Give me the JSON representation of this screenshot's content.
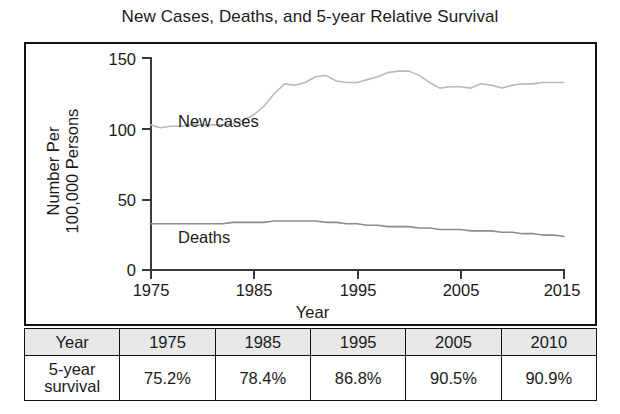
{
  "chart_data": {
    "type": "line",
    "title": "New Cases, Deaths, and 5-year Relative Survival",
    "xlabel": "Year",
    "ylabel": "Number Per 100,000 Persons",
    "ylabel_lines": [
      "Number Per",
      "100,000 Persons"
    ],
    "xlim": [
      1975,
      2015
    ],
    "ylim": [
      0,
      150
    ],
    "yticks": [
      0,
      50,
      100,
      150
    ],
    "xticks": [
      1975,
      1985,
      1995,
      2005,
      2015
    ],
    "grid": false,
    "legend": "inline-labels",
    "line_color": "#b9b9b9",
    "deaths_color": "#8c8c8c",
    "x": [
      1975,
      1976,
      1977,
      1978,
      1979,
      1980,
      1981,
      1982,
      1983,
      1984,
      1985,
      1986,
      1987,
      1988,
      1989,
      1990,
      1991,
      1992,
      1993,
      1994,
      1995,
      1996,
      1997,
      1998,
      1999,
      2000,
      2001,
      2002,
      2003,
      2004,
      2005,
      2006,
      2007,
      2008,
      2009,
      2010,
      2011,
      2012,
      2013,
      2014,
      2015
    ],
    "series": [
      {
        "name": "New cases",
        "label": "New cases",
        "values": [
          102,
          100,
          101,
          101,
          102,
          102,
          102,
          102,
          103,
          105,
          109,
          115,
          124,
          131,
          130,
          132,
          136,
          137,
          133,
          132,
          132,
          134,
          136,
          139,
          140,
          140,
          137,
          132,
          128,
          129,
          129,
          128,
          131,
          130,
          128,
          130,
          131,
          131,
          132,
          132,
          132
        ]
      },
      {
        "name": "Deaths",
        "label": "Deaths",
        "values": [
          32,
          32,
          32,
          32,
          32,
          32,
          32,
          32,
          33,
          33,
          33,
          33,
          34,
          34,
          34,
          34,
          34,
          33,
          33,
          32,
          32,
          31,
          31,
          30,
          30,
          30,
          29,
          29,
          28,
          28,
          28,
          27,
          27,
          27,
          26,
          26,
          25,
          25,
          24,
          24,
          23
        ]
      }
    ]
  },
  "table": {
    "columns": [
      "Year",
      "1975",
      "1985",
      "1995",
      "2005",
      "2010"
    ],
    "rows": [
      {
        "header_lines": [
          "5-year",
          "survival"
        ],
        "values": [
          "75.2%",
          "78.4%",
          "86.8%",
          "90.5%",
          "90.9%"
        ]
      }
    ]
  }
}
